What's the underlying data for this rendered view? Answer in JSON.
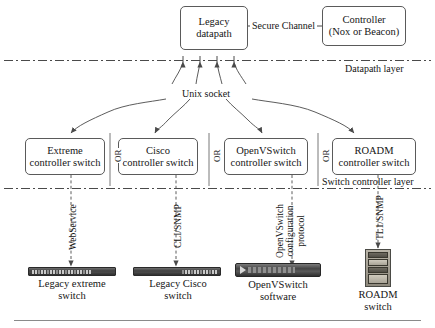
{
  "figure": {
    "width": 435,
    "height": 328,
    "line_color": "#5a5a5a",
    "text_color": "#151515",
    "background": "#ffffff"
  },
  "top_layer": {
    "datapath_box": {
      "line1": "Legacy",
      "line2": "datapath"
    },
    "secure_channel_label": "Secure Channel",
    "controller_box": {
      "line1": "Controller",
      "line2": "(Nox or Beacon)"
    },
    "layer_label": "Datapath layer",
    "socket_label": "Unix socket"
  },
  "switch_controller_layer": {
    "layer_label": "Switch controller layer",
    "or_label": "OR",
    "boxes": [
      {
        "line1": "Extreme",
        "line2": "controller switch"
      },
      {
        "line1": "Cisco",
        "line2": "controller switch"
      },
      {
        "line1": "OpenVSwitch",
        "line2": "controller switch"
      },
      {
        "line1": "ROADM",
        "line2": "controller switch"
      }
    ]
  },
  "device_layer": {
    "protocols": [
      {
        "lines": [
          "WebService"
        ]
      },
      {
        "lines": [
          "CLI/SNMP"
        ]
      },
      {
        "lines": [
          "OpenVSwitch",
          "configuration",
          "protocol"
        ]
      },
      {
        "lines": [
          "TL1/SNMP"
        ]
      }
    ],
    "devices": [
      {
        "icon": "rack-switch-icon",
        "caption_line1": "Legacy extreme",
        "caption_line2": "switch"
      },
      {
        "icon": "rack-switch-icon",
        "caption_line1": "Legacy Cisco",
        "caption_line2": "switch"
      },
      {
        "icon": "server-icon",
        "caption_line1": "OpenVSwitch",
        "caption_line2": "software"
      },
      {
        "icon": "roadm-chassis-icon",
        "caption_line1": "ROADM",
        "caption_line2": "switch"
      }
    ]
  }
}
